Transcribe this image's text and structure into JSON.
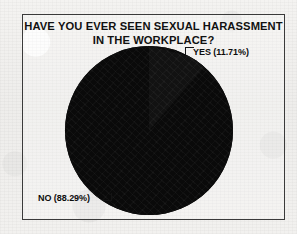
{
  "figure": {
    "title_line_1": "HAVE YOU EVER SEEN SEXUAL HARASSMENT",
    "title_line_2": "IN THE WORKPLACE?",
    "label_yes": "YES (11.71%)",
    "label_no": "NO (88.29%)",
    "colors": {
      "slice": "#0a0a0a",
      "frame": "#3a3a3a",
      "paper": "#f1f0ee",
      "text": "#111111"
    }
  },
  "chart_data": {
    "type": "pie",
    "title": "HAVE YOU EVER SEEN SEXUAL HARASSMENT IN THE WORKPLACE?",
    "xlabel": "",
    "ylabel": "",
    "grid": false,
    "legend_position": "callout-labels",
    "categories": [
      "YES",
      "NO"
    ],
    "values": [
      11.71,
      88.29
    ],
    "units": "percent",
    "data_labels": [
      "YES (11.71%)",
      "NO (88.29%)"
    ],
    "slice_colors": [
      "#121212",
      "#0a0a0a"
    ],
    "start_angle_deg": 0,
    "direction": "clockwise",
    "annotations": [
      {
        "text": "YES (11.71%)",
        "position": "top-right",
        "leader": true
      },
      {
        "text": "NO (88.29%)",
        "position": "bottom-left",
        "leader": true
      }
    ]
  }
}
